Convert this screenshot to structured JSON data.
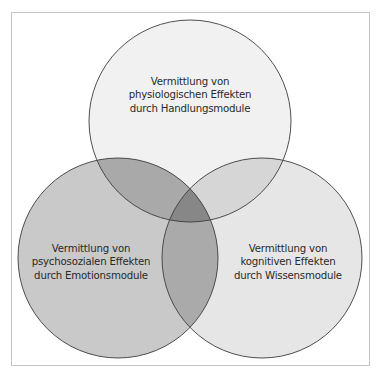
{
  "diagram": {
    "type": "venn",
    "circles": [
      {
        "id": "top",
        "lines": [
          "Vermittlung von",
          "physiologischen Effekten",
          "durch Handlungsmodule"
        ],
        "fill": "#f1f1f1"
      },
      {
        "id": "left",
        "lines": [
          "Vermittlung von",
          "psychosozialen Effekten",
          "durch Emotionsmodule"
        ],
        "fill": "#c9c9c9"
      },
      {
        "id": "right",
        "lines": [
          "Vermittlung von",
          "kognitiven Effekten",
          "durch Wissensmodule"
        ],
        "fill": "#e6e6e6"
      }
    ],
    "overlap_colors": {
      "top_left": "#a9a9a9",
      "top_right": "#d6d6d6",
      "left_right": "#aaaaaa",
      "all": "#878787"
    },
    "stroke": "#3c3c3c"
  }
}
